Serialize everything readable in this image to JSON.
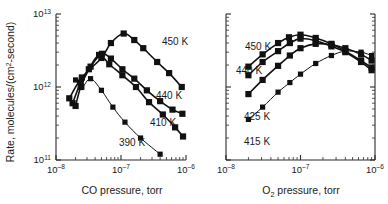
{
  "figure": {
    "background": "#ffffff",
    "ink_color": "#111111"
  },
  "chart_data": [
    {
      "type": "line",
      "panel": "left",
      "title": "",
      "xlabel": "CO pressure, torr",
      "ylabel": "Rate, molecules/(cm2·second)",
      "ylabel_parts": {
        "lead": "Rate, molecules/(cm",
        "sup": "2",
        "tail": "-second)"
      },
      "xscale": "log",
      "yscale": "log",
      "xlim": [
        1e-08,
        1e-06
      ],
      "ylim": [
        100000000000.0,
        10000000000000.0
      ],
      "grid": false,
      "legend": "inline-annotations",
      "xticks": [
        {
          "value": 1e-08,
          "mantissa": "10",
          "exponent": "–8"
        },
        {
          "value": 1e-07,
          "mantissa": "10",
          "exponent": "–7"
        },
        {
          "value": 1e-06,
          "mantissa": "10",
          "exponent": "–6"
        }
      ],
      "yticks": [
        {
          "value": 100000000000.0,
          "mantissa": "10",
          "exponent": "11"
        },
        {
          "value": 1000000000000.0,
          "mantissa": "10",
          "exponent": "12"
        },
        {
          "value": 10000000000000.0,
          "mantissa": "10",
          "exponent": "13"
        }
      ],
      "series": [
        {
          "name": "450 K",
          "label": "450 K",
          "marker": "filled-square",
          "points": [
            {
              "x": 1.6e-08,
              "y": 700000000000.0
            },
            {
              "x": 2.5e-08,
              "y": 1350000000000.0
            },
            {
              "x": 5e-08,
              "y": 2500000000000.0
            },
            {
              "x": 7e-08,
              "y": 4000000000000.0
            },
            {
              "x": 1.1e-07,
              "y": 5400000000000.0
            },
            {
              "x": 1.6e-07,
              "y": 4400000000000.0
            },
            {
              "x": 2.2e-07,
              "y": 3400000000000.0
            },
            {
              "x": 3.6e-07,
              "y": 2200000000000.0
            },
            {
              "x": 5.5e-07,
              "y": 1550000000000.0
            },
            {
              "x": 8.6e-07,
              "y": 1000000000000.0
            }
          ]
        },
        {
          "name": "440 K",
          "label": "440 K",
          "marker": "filled-square",
          "points": [
            {
              "x": 1.8e-08,
              "y": 600000000000.0
            },
            {
              "x": 2.4e-08,
              "y": 1150000000000.0
            },
            {
              "x": 3.4e-08,
              "y": 1900000000000.0
            },
            {
              "x": 5.1e-08,
              "y": 2850000000000.0
            },
            {
              "x": 7e-08,
              "y": 2450000000000.0
            },
            {
              "x": 1.05e-07,
              "y": 1750000000000.0
            },
            {
              "x": 1.6e-07,
              "y": 1300000000000.0
            },
            {
              "x": 2.5e-07,
              "y": 900000000000.0
            },
            {
              "x": 4e-07,
              "y": 640000000000.0
            },
            {
              "x": 6.2e-07,
              "y": 490000000000.0
            },
            {
              "x": 8.8e-07,
              "y": 430000000000.0
            }
          ]
        },
        {
          "name": "410 K",
          "label": "410 K",
          "marker": "filled-square",
          "points": [
            {
              "x": 2e-08,
              "y": 550000000000.0
            },
            {
              "x": 2.4e-08,
              "y": 1000000000000.0
            },
            {
              "x": 3.2e-08,
              "y": 1750000000000.0
            },
            {
              "x": 4.6e-08,
              "y": 2750000000000.0
            },
            {
              "x": 6.6e-08,
              "y": 2050000000000.0
            },
            {
              "x": 1.05e-07,
              "y": 1450000000000.0
            },
            {
              "x": 1.7e-07,
              "y": 1000000000000.0
            },
            {
              "x": 2.7e-07,
              "y": 620000000000.0
            },
            {
              "x": 4.4e-07,
              "y": 420000000000.0
            },
            {
              "x": 6.8e-07,
              "y": 280000000000.0
            },
            {
              "x": 9e-07,
              "y": 210000000000.0
            }
          ]
        },
        {
          "name": "390 K",
          "label": "390 K",
          "marker": "filled-square",
          "points": [
            {
              "x": 2e-08,
              "y": 1250000000000.0
            },
            {
              "x": 2.5e-08,
              "y": 1000000000000.0
            },
            {
              "x": 3.4e-08,
              "y": 1300000000000.0
            },
            {
              "x": 5e-08,
              "y": 900000000000.0
            },
            {
              "x": 7.5e-08,
              "y": 530000000000.0
            },
            {
              "x": 1.15e-07,
              "y": 330000000000.0
            },
            {
              "x": 2e-07,
              "y": 200000000000.0
            },
            {
              "x": 4e-07,
              "y": 120000000000.0
            }
          ]
        }
      ]
    },
    {
      "type": "line",
      "panel": "right",
      "title": "",
      "xlabel": "O2 pressure, torr",
      "xlabel_parts": {
        "lead": "O",
        "sub": "2",
        "tail": " pressure, torr"
      },
      "ylabel": "",
      "xscale": "log",
      "yscale": "log",
      "xlim": [
        1e-08,
        1e-06
      ],
      "ylim": [
        100000000000.0,
        10000000000000.0
      ],
      "grid": false,
      "legend": "inline-annotations",
      "xticks": [
        {
          "value": 1e-08,
          "mantissa": "10",
          "exponent": "–8"
        },
        {
          "value": 1e-07,
          "mantissa": "10",
          "exponent": "–7"
        },
        {
          "value": 1e-06,
          "mantissa": "10",
          "exponent": "–6"
        }
      ],
      "yticks": [
        {
          "value": 100000000000.0,
          "mantissa": "",
          "exponent": ""
        },
        {
          "value": 1000000000000.0,
          "mantissa": "",
          "exponent": ""
        },
        {
          "value": 10000000000000.0,
          "mantissa": "",
          "exponent": ""
        }
      ],
      "series": [
        {
          "name": "450 K",
          "label": "450 K",
          "marker": "filled-square",
          "points": [
            {
              "x": 2e-08,
              "y": 1900000000000.0
            },
            {
              "x": 3.1e-08,
              "y": 2800000000000.0
            },
            {
              "x": 5e-08,
              "y": 4000000000000.0
            },
            {
              "x": 7e-08,
              "y": 4800000000000.0
            },
            {
              "x": 1e-07,
              "y": 5200000000000.0
            },
            {
              "x": 1.6e-07,
              "y": 4700000000000.0
            },
            {
              "x": 2.6e-07,
              "y": 3900000000000.0
            },
            {
              "x": 4e-07,
              "y": 3100000000000.0
            },
            {
              "x": 6.5e-07,
              "y": 2300000000000.0
            },
            {
              "x": 9e-07,
              "y": 1850000000000.0
            }
          ]
        },
        {
          "name": "440 K",
          "label": "440 K",
          "marker": "filled-square",
          "points": [
            {
              "x": 2e-08,
              "y": 1450000000000.0
            },
            {
              "x": 3.1e-08,
              "y": 2200000000000.0
            },
            {
              "x": 5e-08,
              "y": 3100000000000.0
            },
            {
              "x": 7.2e-08,
              "y": 4000000000000.0
            },
            {
              "x": 1e-07,
              "y": 4600000000000.0
            },
            {
              "x": 1.6e-07,
              "y": 4300000000000.0
            },
            {
              "x": 2.6e-07,
              "y": 3600000000000.0
            },
            {
              "x": 4e-07,
              "y": 3000000000000.0
            },
            {
              "x": 6.5e-07,
              "y": 2200000000000.0
            },
            {
              "x": 9e-07,
              "y": 1700000000000.0
            }
          ]
        },
        {
          "name": "425 K",
          "label": "425 K",
          "marker": "filled-square",
          "points": [
            {
              "x": 2e-08,
              "y": 800000000000.0
            },
            {
              "x": 3.1e-08,
              "y": 1250000000000.0
            },
            {
              "x": 5e-08,
              "y": 1950000000000.0
            },
            {
              "x": 7.2e-08,
              "y": 2700000000000.0
            },
            {
              "x": 1e-07,
              "y": 3400000000000.0
            },
            {
              "x": 1.6e-07,
              "y": 3900000000000.0
            },
            {
              "x": 2.6e-07,
              "y": 3800000000000.0
            },
            {
              "x": 4e-07,
              "y": 3400000000000.0
            },
            {
              "x": 6.5e-07,
              "y": 2800000000000.0
            },
            {
              "x": 9e-07,
              "y": 2300000000000.0
            }
          ]
        },
        {
          "name": "415 K",
          "label": "415 K",
          "marker": "filled-square",
          "points": [
            {
              "x": 2e-08,
              "y": 360000000000.0
            },
            {
              "x": 3.1e-08,
              "y": 530000000000.0
            },
            {
              "x": 5e-08,
              "y": 850000000000.0
            },
            {
              "x": 7.2e-08,
              "y": 1150000000000.0
            },
            {
              "x": 1e-07,
              "y": 1500000000000.0
            },
            {
              "x": 1.6e-07,
              "y": 2100000000000.0
            },
            {
              "x": 2.6e-07,
              "y": 2700000000000.0
            },
            {
              "x": 4e-07,
              "y": 3100000000000.0
            },
            {
              "x": 6.5e-07,
              "y": 3000000000000.0
            },
            {
              "x": 9e-07,
              "y": 2700000000000.0
            }
          ]
        }
      ]
    }
  ],
  "annotations": {
    "left": [
      {
        "text": "450 K",
        "x": 162,
        "y": 45
      },
      {
        "text": "440 K",
        "x": 156,
        "y": 99
      },
      {
        "text": "410 K",
        "x": 150,
        "y": 126
      },
      {
        "text": "390 K",
        "x": 119,
        "y": 146
      }
    ],
    "right": [
      {
        "text": "450 K",
        "x": 245,
        "y": 50
      },
      {
        "text": "440 K",
        "x": 236,
        "y": 74
      },
      {
        "text": "425 K",
        "x": 244,
        "y": 120
      },
      {
        "text": "415 K",
        "x": 244,
        "y": 145
      }
    ]
  }
}
